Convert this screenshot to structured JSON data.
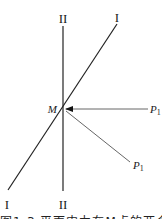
{
  "diagram": {
    "lines": {
      "line_I": {
        "label_top": "I",
        "label_bottom": "I"
      },
      "line_II": {
        "label_top": "II",
        "label_bottom": "II"
      }
    },
    "point_M": {
      "label": "M"
    },
    "rays": [
      {
        "label": "P",
        "subscript": "1",
        "direction": "horizontal"
      },
      {
        "label": "P",
        "subscript": "1",
        "direction": "diagonal-down"
      }
    ],
    "caption": "图1-3  平面内力在M点的两个方向"
  }
}
